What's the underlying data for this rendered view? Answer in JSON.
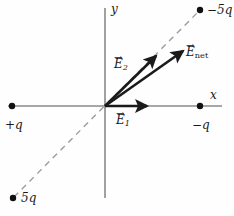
{
  "figure": {
    "background_color": "#fefefe",
    "axis_color": "#8a8a8a",
    "vector_color": "#1a1a1a",
    "dash_color": "#9a9a9a",
    "charge_dot_color": "#111111",
    "width": 234,
    "height": 216
  },
  "axes": {
    "x_label": "x",
    "y_label": "y",
    "origin": {
      "x": 105,
      "y": 106
    },
    "x_start": {
      "x": 8,
      "y": 106
    },
    "x_end": {
      "x": 222,
      "y": 106
    },
    "y_start": {
      "x": 105,
      "y": 8
    },
    "y_end": {
      "x": 105,
      "y": 198
    }
  },
  "charges": [
    {
      "name": "charge-plus-q",
      "label": "+q",
      "dot": {
        "x": 12,
        "y": 106
      },
      "label_pos": {
        "x": 5,
        "y": 119
      }
    },
    {
      "name": "charge-minus-q",
      "label": "−q",
      "dot": {
        "x": 200,
        "y": 106
      },
      "label_pos": {
        "x": 192,
        "y": 119
      }
    },
    {
      "name": "charge-minus-5q",
      "label": "−5q",
      "dot": {
        "x": 200,
        "y": 10
      },
      "label_pos": {
        "x": 207,
        "y": 4
      }
    },
    {
      "name": "charge-plus-5q",
      "label": "5q",
      "dot": {
        "x": 13,
        "y": 198
      },
      "label_pos": {
        "x": 21,
        "y": 192
      }
    }
  ],
  "dashed_line": {
    "name": "charge-axis-dashed-line",
    "from": {
      "x": 14,
      "y": 197
    },
    "to": {
      "x": 198,
      "y": 12
    }
  },
  "vectors": [
    {
      "name": "vector-e1",
      "label": "E",
      "subscript": "1",
      "subscript_style": "italic-number",
      "from": {
        "x": 105,
        "y": 106
      },
      "to": {
        "x": 147,
        "y": 106
      },
      "label_pos": {
        "x": 116,
        "y": 114
      }
    },
    {
      "name": "vector-e2",
      "label": "E",
      "subscript": "2",
      "subscript_style": "italic-number",
      "from": {
        "x": 105,
        "y": 106
      },
      "to": {
        "x": 156,
        "y": 56
      },
      "label_pos": {
        "x": 114,
        "y": 58
      }
    },
    {
      "name": "vector-enet",
      "label": "E",
      "subscript": "net",
      "subscript_style": "upright-word",
      "from": {
        "x": 105,
        "y": 106
      },
      "to": {
        "x": 183,
        "y": 51
      },
      "label_pos": {
        "x": 186,
        "y": 46
      }
    }
  ]
}
